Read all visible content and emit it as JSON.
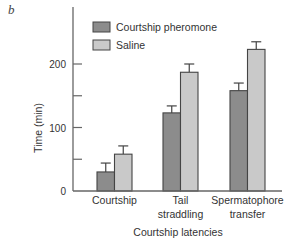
{
  "panel_label": "b",
  "chart_data": {
    "type": "bar",
    "title": "",
    "xlabel": "Courtship latencies",
    "ylabel": "Time (min)",
    "ylim": [
      0,
      250
    ],
    "yticks": [
      0,
      50,
      100,
      150,
      200
    ],
    "ytick_labels": [
      "0",
      "",
      "100",
      "",
      "200"
    ],
    "grid": false,
    "legend_position": "upper left inside",
    "categories": [
      "Courtship",
      "Tail straddling",
      "Spermatophore transfer"
    ],
    "category_lines": [
      [
        "Courtship"
      ],
      [
        "Tail",
        "straddling"
      ],
      [
        "Spermatophore",
        "transfer"
      ]
    ],
    "series": [
      {
        "name": "Courtship pheromone",
        "color": "#8c8c8c",
        "values": [
          30,
          123,
          158
        ],
        "error": [
          14,
          11,
          12
        ]
      },
      {
        "name": "Saline",
        "color": "#c9c9c9",
        "values": [
          58,
          187,
          223
        ],
        "error": [
          13,
          13,
          12
        ]
      }
    ]
  }
}
